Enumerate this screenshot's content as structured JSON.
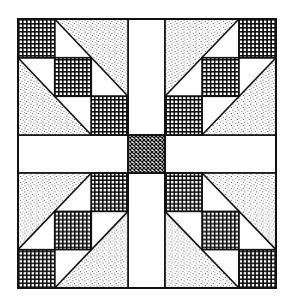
{
  "figure": {
    "pattern_symmetry": "four-fold mirror",
    "colors": {
      "background": "#ffffff",
      "ink": "#111111",
      "stipple_fill": "speckled gray dots",
      "plaid_fill": "dense cross-hatch grid",
      "center_fill": "fine diagonal crosshatch"
    },
    "layout": {
      "block": {
        "x": 18,
        "y": 19,
        "w": 258,
        "h": 269
      },
      "vertical_sash": {
        "x1": 128,
        "x2": 165
      },
      "horizontal_sash": {
        "y1": 135,
        "y2": 173
      }
    },
    "quadrants": [
      {
        "name": "top-left",
        "diagonal": "descending",
        "plaid_squares": 3,
        "stipple_triangles": 2
      },
      {
        "name": "top-right",
        "diagonal": "ascending",
        "plaid_squares": 3,
        "stipple_triangles": 2
      },
      {
        "name": "bottom-left",
        "diagonal": "ascending",
        "plaid_squares": 3,
        "stipple_triangles": 2
      },
      {
        "name": "bottom-right",
        "diagonal": "descending",
        "plaid_squares": 3,
        "stipple_triangles": 2
      }
    ],
    "center_square": "crosshatched cornerstone"
  }
}
